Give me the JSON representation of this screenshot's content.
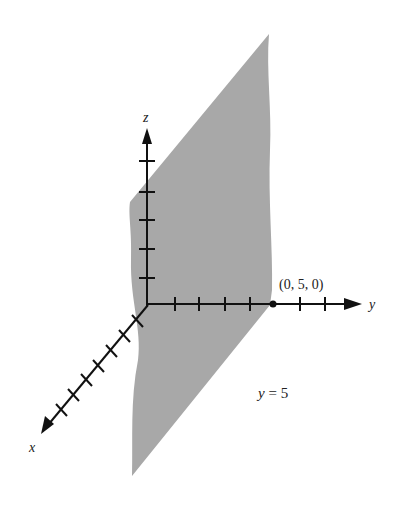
{
  "figure": {
    "plane_label": "y = 5",
    "point_label": "(0, 5, 0)",
    "axes": {
      "x": {
        "label": "x",
        "ticks": 7
      },
      "y": {
        "label": "y",
        "ticks": 6
      },
      "z": {
        "label": "z",
        "ticks": 5
      }
    },
    "colors": {
      "plane": "#a8a8a8",
      "axis": "#111111",
      "background": "#ffffff"
    }
  }
}
